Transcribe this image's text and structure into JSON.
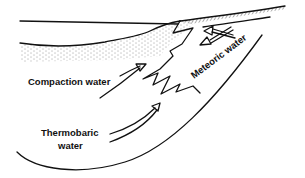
{
  "diagram": {
    "labels": {
      "compaction": "Compaction water",
      "meteoric": "Meteoric water",
      "thermobaric_line1": "Thermobaric",
      "thermobaric_line2": "water"
    },
    "colors": {
      "ink": "#111111",
      "background": "#ffffff"
    }
  }
}
